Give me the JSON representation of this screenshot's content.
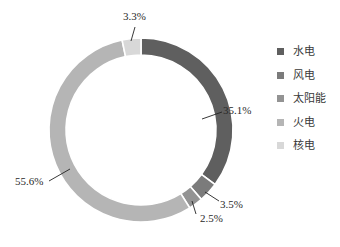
{
  "chart_data": {
    "type": "pie",
    "variant": "donut",
    "title": "",
    "categories": [
      "水电",
      "风电",
      "太阳能",
      "火电",
      "核电"
    ],
    "values": [
      35.1,
      3.5,
      2.5,
      55.6,
      3.3
    ],
    "value_labels": [
      "35.1%",
      "3.5%",
      "2.5%",
      "55.6%",
      "3.3%"
    ],
    "colors": [
      "#5f5f5f",
      "#7b7b7b",
      "#939393",
      "#b5b5b5",
      "#d8d8d8"
    ],
    "start_angle_deg": 0,
    "direction": "clockwise",
    "legend_position": "right",
    "unit": "%"
  },
  "legend": {
    "items": [
      {
        "label": "水电",
        "color": "#5f5f5f"
      },
      {
        "label": "风电",
        "color": "#7b7b7b"
      },
      {
        "label": "太阳能",
        "color": "#939393"
      },
      {
        "label": "火电",
        "color": "#b5b5b5"
      },
      {
        "label": "核电",
        "color": "#d8d8d8"
      }
    ]
  }
}
